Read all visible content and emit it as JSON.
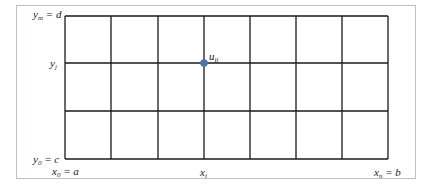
{
  "figure": {
    "type": "grid-mesh",
    "grid": {
      "columns": 7,
      "rows": 3,
      "x_lines_px": [
        65,
        111,
        158,
        204,
        250,
        296,
        342,
        388
      ],
      "y_lines_px": [
        16,
        63,
        111,
        159
      ],
      "line_color": "#1a1a1a"
    },
    "point": {
      "label_base": "u",
      "label_sub": "ij",
      "color": "#4a72b0",
      "x_px": 204,
      "y_px": 63
    },
    "labels": {
      "y_top": {
        "base": "y",
        "sub": "m",
        "rest": " = d"
      },
      "y_mid": {
        "base": "y",
        "sub": "j",
        "rest": ""
      },
      "y_bottom": {
        "base": "y",
        "sub": "0",
        "rest": " = c"
      },
      "x_left": {
        "base": "x",
        "sub": "0",
        "rest": " = a"
      },
      "x_mid": {
        "base": "x",
        "sub": "i",
        "rest": ""
      },
      "x_right": {
        "base": "x",
        "sub": "n",
        "rest": " = b"
      }
    },
    "frame_color": "#b9bdd6"
  }
}
